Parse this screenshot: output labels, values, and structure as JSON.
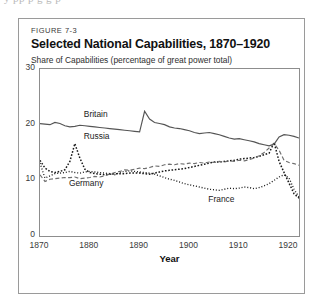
{
  "page": {
    "cut_off_header_text": "y  pp       p      g  g   p"
  },
  "figure": {
    "number_label": "FIGURE 7-3",
    "title": "Selected National Capabilities, 1870–1920",
    "subtitle": "Share of Capabilities (percentage of great power total)"
  },
  "chart_data": {
    "type": "line",
    "title": "Selected National Capabilities, 1870–1920",
    "subtitle": "Share of Capabilities (percentage of great power total)",
    "xlabel": "Year",
    "ylabel": "",
    "xlim": [
      1870,
      1922
    ],
    "ylim": [
      0,
      30
    ],
    "xticks": [
      1870,
      1880,
      1890,
      1900,
      1910,
      1920
    ],
    "yticks": [
      0,
      10,
      20,
      30
    ],
    "grid": false,
    "legend": "inline-labels",
    "series": [
      {
        "name": "Britain",
        "style": "solid",
        "color": "#555555",
        "label_x": 1879,
        "label_y": 21.6,
        "x": [
          1870,
          1871,
          1872,
          1873,
          1874,
          1875,
          1876,
          1877,
          1878,
          1879,
          1880,
          1881,
          1882,
          1883,
          1884,
          1885,
          1886,
          1887,
          1888,
          1889,
          1890,
          1891,
          1892,
          1893,
          1894,
          1895,
          1896,
          1897,
          1898,
          1899,
          1900,
          1901,
          1902,
          1903,
          1904,
          1905,
          1906,
          1907,
          1908,
          1909,
          1910,
          1911,
          1912,
          1913,
          1914,
          1915,
          1916,
          1917,
          1918,
          1919,
          1920,
          1921,
          1922
        ],
        "y": [
          20.2,
          20.1,
          20.0,
          20.4,
          20.2,
          19.8,
          19.6,
          19.7,
          19.9,
          19.8,
          19.7,
          19.6,
          19.5,
          19.4,
          19.3,
          19.2,
          19.1,
          19.0,
          18.9,
          18.8,
          18.7,
          22.4,
          21.0,
          20.4,
          20.2,
          20.0,
          19.6,
          19.4,
          19.3,
          19.1,
          18.9,
          18.6,
          18.4,
          18.5,
          18.6,
          18.4,
          18.2,
          17.9,
          17.6,
          17.4,
          17.5,
          17.3,
          17.1,
          16.9,
          16.6,
          16.4,
          16.2,
          16.5,
          17.8,
          18.2,
          18.1,
          17.9,
          17.6
        ]
      },
      {
        "name": "Russia",
        "style": "dotted",
        "color": "#1a1a1a",
        "label_x": 1879,
        "label_y": 17.6,
        "x": [
          1870,
          1871,
          1872,
          1873,
          1874,
          1875,
          1876,
          1877,
          1878,
          1879,
          1880,
          1881,
          1882,
          1883,
          1884,
          1885,
          1886,
          1887,
          1888,
          1889,
          1890,
          1891,
          1892,
          1893,
          1894,
          1895,
          1896,
          1897,
          1898,
          1899,
          1900,
          1901,
          1902,
          1903,
          1904,
          1905,
          1906,
          1907,
          1908,
          1909,
          1910,
          1911,
          1912,
          1913,
          1914,
          1915,
          1916,
          1917,
          1918,
          1919,
          1920,
          1921,
          1922
        ],
        "y": [
          13.6,
          12.2,
          11.6,
          11.4,
          11.6,
          11.9,
          13.4,
          16.6,
          14.0,
          12.0,
          11.4,
          11.2,
          11.1,
          11.0,
          11.1,
          11.2,
          11.2,
          11.2,
          11.3,
          11.3,
          11.3,
          11.2,
          11.1,
          11.3,
          11.5,
          11.7,
          11.8,
          11.9,
          12.0,
          12.1,
          12.3,
          12.5,
          12.7,
          12.9,
          13.1,
          13.3,
          13.3,
          13.4,
          13.5,
          13.6,
          13.8,
          13.9,
          14.0,
          14.1,
          14.3,
          14.6,
          14.9,
          16.8,
          13.4,
          11.4,
          9.5,
          7.6,
          6.8
        ]
      },
      {
        "name": "Germany",
        "style": "dashed",
        "color": "#6e6e6e",
        "label_x": 1876,
        "label_y": 9.2,
        "x": [
          1870,
          1871,
          1872,
          1873,
          1874,
          1875,
          1876,
          1877,
          1878,
          1879,
          1880,
          1881,
          1882,
          1883,
          1884,
          1885,
          1886,
          1887,
          1888,
          1889,
          1890,
          1891,
          1892,
          1893,
          1894,
          1895,
          1896,
          1897,
          1898,
          1899,
          1900,
          1901,
          1902,
          1903,
          1904,
          1905,
          1906,
          1907,
          1908,
          1909,
          1910,
          1911,
          1912,
          1913,
          1914,
          1915,
          1916,
          1917,
          1918,
          1919,
          1920,
          1921,
          1922
        ],
        "y": [
          11.0,
          9.8,
          10.2,
          10.3,
          10.4,
          10.5,
          10.5,
          10.6,
          10.3,
          10.4,
          10.5,
          10.7,
          10.6,
          10.8,
          11.1,
          11.4,
          11.6,
          11.9,
          11.8,
          12.0,
          12.2,
          12.1,
          12.3,
          12.6,
          12.5,
          12.8,
          12.9,
          12.8,
          13.0,
          12.9,
          13.1,
          13.0,
          13.2,
          13.1,
          13.3,
          13.2,
          13.4,
          13.3,
          13.5,
          13.4,
          13.6,
          13.5,
          13.7,
          14.0,
          14.4,
          15.0,
          15.8,
          16.6,
          15.4,
          13.6,
          13.2,
          13.0,
          12.7
        ]
      },
      {
        "name": "France",
        "style": "fine-dotted",
        "color": "#1a1a1a",
        "label_x": 1904,
        "label_y": 6.2,
        "x": [
          1870,
          1871,
          1872,
          1873,
          1874,
          1875,
          1876,
          1877,
          1878,
          1879,
          1880,
          1881,
          1882,
          1883,
          1884,
          1885,
          1886,
          1887,
          1888,
          1889,
          1890,
          1891,
          1892,
          1893,
          1894,
          1895,
          1896,
          1897,
          1898,
          1899,
          1900,
          1901,
          1902,
          1903,
          1904,
          1905,
          1906,
          1907,
          1908,
          1909,
          1910,
          1911,
          1912,
          1913,
          1914,
          1915,
          1916,
          1917,
          1918,
          1919,
          1920,
          1921,
          1922
        ],
        "y": [
          13.1,
          10.4,
          10.8,
          11.2,
          11.3,
          11.4,
          11.6,
          11.4,
          11.3,
          11.5,
          11.6,
          11.5,
          11.4,
          11.3,
          11.2,
          11.0,
          11.4,
          11.6,
          11.7,
          11.6,
          11.5,
          11.4,
          11.3,
          11.1,
          10.8,
          10.5,
          10.2,
          10.0,
          9.7,
          9.4,
          9.2,
          9.0,
          8.8,
          8.6,
          8.4,
          8.3,
          8.2,
          8.4,
          8.6,
          8.5,
          8.6,
          8.8,
          8.7,
          8.5,
          8.7,
          9.0,
          9.4,
          10.0,
          10.6,
          11.0,
          10.4,
          8.4,
          7.0
        ]
      }
    ]
  }
}
